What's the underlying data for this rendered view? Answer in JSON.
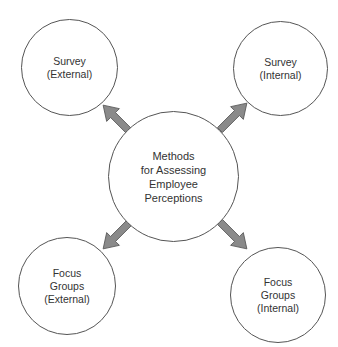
{
  "diagram": {
    "center": {
      "label": "Methods\nfor Assessing\nEmployee\nPerceptions"
    },
    "nodes": [
      {
        "id": "survey-external",
        "label": "Survey\n(External)"
      },
      {
        "id": "survey-internal",
        "label": "Survey\n(Internal)"
      },
      {
        "id": "focus-groups-external",
        "label": "Focus\nGroups\n(External)"
      },
      {
        "id": "focus-groups-internal",
        "label": "Focus\nGroups\n(Internal)"
      }
    ],
    "edges": [
      {
        "from": "center",
        "to": "survey-external"
      },
      {
        "from": "center",
        "to": "survey-internal"
      },
      {
        "from": "center",
        "to": "focus-groups-external"
      },
      {
        "from": "center",
        "to": "focus-groups-internal"
      }
    ],
    "colors": {
      "arrow_fill": "#8a8a8a",
      "arrow_stroke": "#555555",
      "circle_stroke": "#555555"
    }
  }
}
